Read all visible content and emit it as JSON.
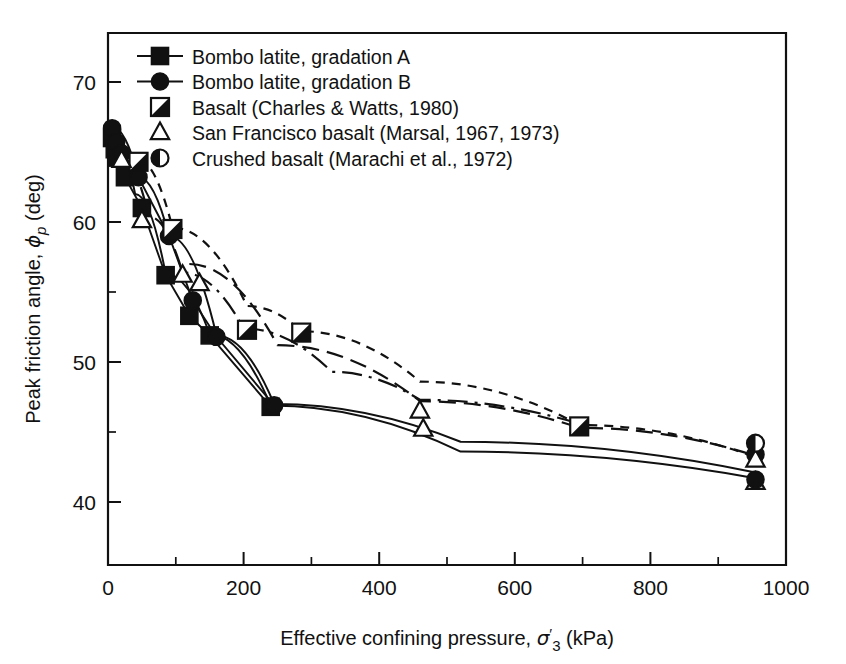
{
  "figure": {
    "background_color": "#ffffff",
    "ink_color": "#111111"
  },
  "chart_data": {
    "type": "scatter",
    "title": "",
    "xlabel_text": "Effective confining pressure, σ'3 (kPa)",
    "xlabel_prefix": "Effective confining pressure, ",
    "xlabel_symbol": "σ",
    "xlabel_prime": "′",
    "xlabel_subscript": "3",
    "xlabel_units": " (kPa)",
    "ylabel_text": "Peak friction angle, φp (deg)",
    "ylabel_prefix": "Peak friction angle, ",
    "ylabel_symbol": "ϕ",
    "ylabel_subscript": "p",
    "ylabel_units": " (deg)",
    "xlim": [
      0,
      1000
    ],
    "ylim": [
      35.5,
      73.5
    ],
    "x_major_ticks": [
      0,
      200,
      400,
      600,
      800,
      1000
    ],
    "x_minor_ticks": [
      100,
      300,
      500,
      700,
      900
    ],
    "x_tick_labels": [
      "0",
      "200",
      "400",
      "600",
      "800",
      "1000"
    ],
    "y_major_ticks": [
      40,
      50,
      60,
      70
    ],
    "y_minor_ticks": [
      45,
      55,
      65
    ],
    "y_tick_labels": [
      "40",
      "50",
      "60",
      "70"
    ],
    "grid": false,
    "legend_position": "top-left-inside",
    "series": [
      {
        "name": "Bombo latite, gradation A",
        "marker": "filled-square",
        "line_style": "solid",
        "legend_has_line": true,
        "points": [
          {
            "x": 6,
            "y": 66.0
          },
          {
            "x": 10,
            "y": 65.2
          },
          {
            "x": 14,
            "y": 64.6
          },
          {
            "x": 25,
            "y": 63.2
          },
          {
            "x": 50,
            "y": 61.0
          },
          {
            "x": 85,
            "y": 56.2
          },
          {
            "x": 120,
            "y": 53.3
          },
          {
            "x": 150,
            "y": 51.9
          },
          {
            "x": 240,
            "y": 46.8
          }
        ]
      },
      {
        "name": "Bombo latite, gradation B",
        "marker": "filled-circle",
        "line_style": "solid",
        "legend_has_line": true,
        "points": [
          {
            "x": 6,
            "y": 66.7
          },
          {
            "x": 12,
            "y": 65.7
          },
          {
            "x": 20,
            "y": 64.9
          },
          {
            "x": 45,
            "y": 63.2
          },
          {
            "x": 90,
            "y": 59.0
          },
          {
            "x": 125,
            "y": 54.4
          },
          {
            "x": 160,
            "y": 51.8
          },
          {
            "x": 245,
            "y": 46.9
          },
          {
            "x": 955,
            "y": 43.4
          }
        ]
      },
      {
        "name": "Basalt (Charles & Watts, 1980)",
        "marker": "half-diag-square",
        "line_style": "dashed",
        "legend_has_line": false,
        "points": [
          {
            "x": 45,
            "y": 64.3
          },
          {
            "x": 95,
            "y": 59.5
          },
          {
            "x": 205,
            "y": 52.3
          },
          {
            "x": 285,
            "y": 52.1
          },
          {
            "x": 695,
            "y": 45.4
          }
        ]
      },
      {
        "name": "San Francisco basalt (Marsal, 1967, 1973)",
        "marker": "open-triangle",
        "line_style": "dash-dot",
        "legend_has_line": false,
        "points": [
          {
            "x": 20,
            "y": 64.4
          },
          {
            "x": 50,
            "y": 60.1
          },
          {
            "x": 110,
            "y": 56.2
          },
          {
            "x": 135,
            "y": 55.6
          },
          {
            "x": 460,
            "y": 46.5
          },
          {
            "x": 465,
            "y": 45.2
          },
          {
            "x": 955,
            "y": 43.0
          },
          {
            "x": 955,
            "y": 41.4
          }
        ]
      },
      {
        "name": "Crushed basalt (Marachi et al., 1972)",
        "marker": "half-left-circle",
        "line_style": "long-dash",
        "legend_has_line": false,
        "points": [
          {
            "x": 955,
            "y": 44.2
          }
        ]
      }
    ],
    "trend_curves": [
      {
        "name": "curve-gradation-a",
        "style": "solid"
      },
      {
        "name": "curve-gradation-b",
        "style": "solid"
      },
      {
        "name": "curve-basalt-charles-watts",
        "style": "short-dash"
      },
      {
        "name": "curve-san-francisco-basalt",
        "style": "dash-dot"
      },
      {
        "name": "curve-crushed-basalt",
        "style": "long-dash"
      }
    ],
    "extra_points": [
      {
        "x": 955,
        "y": 41.6,
        "marker": "filled-circle",
        "series": "Bombo latite, gradation B"
      }
    ]
  },
  "legend": {
    "items": [
      {
        "label": "Bombo latite, gradation A",
        "marker": "filled-square",
        "with_line": true
      },
      {
        "label": "Bombo latite, gradation B",
        "marker": "filled-circle",
        "with_line": true
      },
      {
        "label": "Basalt (Charles & Watts, 1980)",
        "marker": "half-diag-square",
        "with_line": false
      },
      {
        "label": "San Francisco basalt (Marsal, 1967, 1973)",
        "marker": "open-triangle",
        "with_line": false
      },
      {
        "label": "Crushed basalt (Marachi et al., 1972)",
        "marker": "half-left-circle",
        "with_line": false
      }
    ]
  }
}
